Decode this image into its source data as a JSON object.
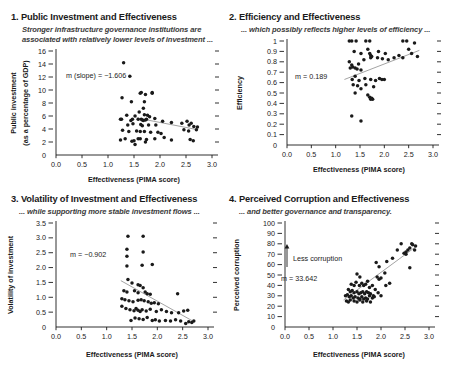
{
  "figure": {
    "panel_count": 4
  },
  "panels": [
    {
      "title": "1. Public Investment and Effectiveness",
      "subtitle_line1": "Stronger infrastructure governance institutions are",
      "subtitle_line2": "associated with relatively lower levels of investment ...",
      "ylabel_line1": "Public investment",
      "ylabel_line2": "(as a percentage of GDP)",
      "xlabel": "Effectiveness (PIMA score)",
      "slope_label": "m (slope) = −1.606"
    },
    {
      "title": "2. Efficiency and Effectiveness",
      "subtitle_line1": "... which possibly reflects higher levels of efficiency ...",
      "subtitle_line2": "",
      "ylabel_line1": "Efficiency",
      "ylabel_line2": "",
      "xlabel": "Effectiveness (PIMA score)",
      "slope_label": "m = 0.189"
    },
    {
      "title": "3. Volatility of Investment and Effectiveness",
      "subtitle_line1": "... while supporting more stable investment flows ...",
      "subtitle_line2": "",
      "ylabel_line1": "Volatility of investment",
      "ylabel_line2": "",
      "xlabel": "Effectiveness (PIMA score)",
      "slope_label": "m = −0.902"
    },
    {
      "title": "4. Perceived Corruption and Effectiveness",
      "subtitle_line1": "... and better governance and transparency.",
      "subtitle_line2": "",
      "ylabel_line1": "Perceived corruption",
      "ylabel_line2": "",
      "xlabel": "Effectiveness (PIMA score)",
      "slope_label": "m = 33.642",
      "arrow_label": "Less corruption"
    }
  ],
  "chart_data": [
    {
      "type": "scatter",
      "title": "1. Public Investment and Effectiveness",
      "subtitle": "Stronger infrastructure governance institutions are associated with relatively lower levels of investment ...",
      "xlabel": "Effectiveness (PIMA score)",
      "ylabel": "Public investment (as a percentage of GDP)",
      "xlim": [
        0.0,
        3.0
      ],
      "ylim": [
        0,
        16
      ],
      "xticks": [
        "0.0",
        "0.5",
        "1.0",
        "1.5",
        "2.0",
        "2.5",
        "3.0"
      ],
      "yticks": [
        "0",
        "2",
        "4",
        "6",
        "8",
        "10",
        "12",
        "14",
        "16"
      ],
      "grid": false,
      "legend": "none",
      "annotation": "m (slope) = −1.606",
      "slope": -1.606,
      "fit_line": {
        "x0": 1.55,
        "y0": 5.7,
        "x1": 2.72,
        "y1": 3.9
      },
      "points": [
        [
          1.3,
          14.2
        ],
        [
          1.42,
          12.1
        ],
        [
          1.27,
          8.8
        ],
        [
          1.62,
          9.5
        ],
        [
          1.64,
          9.6
        ],
        [
          1.72,
          9.3
        ],
        [
          1.85,
          9.5
        ],
        [
          1.85,
          9.6
        ],
        [
          1.7,
          8.2
        ],
        [
          1.45,
          8.2
        ],
        [
          1.68,
          7.2
        ],
        [
          1.6,
          6.6
        ],
        [
          1.36,
          6.1
        ],
        [
          1.52,
          6.0
        ],
        [
          1.7,
          6.2
        ],
        [
          1.76,
          6.1
        ],
        [
          1.8,
          5.9
        ],
        [
          1.24,
          5.5
        ],
        [
          1.26,
          5.5
        ],
        [
          1.47,
          5.5
        ],
        [
          1.44,
          5.3
        ],
        [
          1.58,
          5.5
        ],
        [
          1.64,
          5.5
        ],
        [
          1.66,
          5.4
        ],
        [
          1.68,
          5.3
        ],
        [
          1.72,
          5.4
        ],
        [
          1.74,
          5.5
        ],
        [
          1.9,
          5.6
        ],
        [
          2.05,
          5.2
        ],
        [
          2.22,
          5.0
        ],
        [
          1.38,
          4.6
        ],
        [
          1.48,
          4.8
        ],
        [
          1.63,
          4.7
        ],
        [
          1.66,
          4.5
        ],
        [
          1.78,
          4.6
        ],
        [
          1.92,
          4.6
        ],
        [
          2.42,
          4.9
        ],
        [
          2.52,
          5.2
        ],
        [
          2.56,
          4.6
        ],
        [
          2.6,
          4.9
        ],
        [
          2.65,
          4.4
        ],
        [
          2.72,
          4.3
        ],
        [
          1.28,
          3.8
        ],
        [
          1.4,
          3.6
        ],
        [
          1.55,
          3.7
        ],
        [
          1.62,
          3.6
        ],
        [
          1.7,
          3.6
        ],
        [
          1.82,
          3.5
        ],
        [
          1.96,
          3.5
        ],
        [
          2.02,
          3.3
        ],
        [
          2.46,
          3.9
        ],
        [
          2.55,
          3.7
        ],
        [
          2.7,
          3.9
        ],
        [
          1.24,
          2.3
        ],
        [
          1.33,
          2.5
        ],
        [
          1.46,
          2.1
        ],
        [
          1.5,
          2.2
        ],
        [
          1.58,
          2.5
        ],
        [
          1.62,
          2.5
        ],
        [
          1.74,
          2.4
        ],
        [
          1.9,
          2.5
        ],
        [
          2.08,
          2.7
        ],
        [
          2.22,
          2.3
        ],
        [
          2.58,
          2.4
        ],
        [
          2.64,
          2.2
        ],
        [
          1.52,
          1.6
        ],
        [
          1.72,
          2.0
        ]
      ]
    },
    {
      "type": "scatter",
      "title": "2. Efficiency and Effectiveness",
      "subtitle": "... which possibly reflects higher levels of efficiency ...",
      "xlabel": "Effectiveness (PIMA score)",
      "ylabel": "Efficiency",
      "xlim": [
        0.0,
        3.0
      ],
      "ylim": [
        0,
        1
      ],
      "xticks": [
        "0.0",
        "0.5",
        "1.0",
        "1.5",
        "2.0",
        "2.5",
        "3.0"
      ],
      "yticks": [
        "0",
        "0.1",
        "0.2",
        "0.3",
        "0.4",
        "0.5",
        "0.6",
        "0.7",
        "0.8",
        "0.9",
        "1"
      ],
      "grid": false,
      "legend": "none",
      "annotation": "m = 0.189",
      "slope": 0.189,
      "fit_line": {
        "x0": 1.18,
        "y0": 0.63,
        "x1": 2.72,
        "y1": 0.91
      },
      "points": [
        [
          1.28,
          1.0
        ],
        [
          1.33,
          1.0
        ],
        [
          1.42,
          1.0
        ],
        [
          1.62,
          1.0
        ],
        [
          1.7,
          1.0
        ],
        [
          2.38,
          1.0
        ],
        [
          2.46,
          1.0
        ],
        [
          2.62,
          0.98
        ],
        [
          1.38,
          0.9
        ],
        [
          1.52,
          0.88
        ],
        [
          1.66,
          0.92
        ],
        [
          1.7,
          0.88
        ],
        [
          1.72,
          0.86
        ],
        [
          1.74,
          0.85
        ],
        [
          1.88,
          0.9
        ],
        [
          2.02,
          0.88
        ],
        [
          2.5,
          0.92
        ],
        [
          2.56,
          0.88
        ],
        [
          2.68,
          0.85
        ],
        [
          1.28,
          0.8
        ],
        [
          1.33,
          0.77
        ],
        [
          1.35,
          0.75
        ],
        [
          1.47,
          0.78
        ],
        [
          1.58,
          0.82
        ],
        [
          1.72,
          0.84
        ],
        [
          1.86,
          0.84
        ],
        [
          1.96,
          0.83
        ],
        [
          2.08,
          0.82
        ],
        [
          2.2,
          0.84
        ],
        [
          2.3,
          0.86
        ],
        [
          1.3,
          0.74
        ],
        [
          1.4,
          0.74
        ],
        [
          1.44,
          0.73
        ],
        [
          1.52,
          0.72
        ],
        [
          2.38,
          0.84
        ],
        [
          1.34,
          0.63
        ],
        [
          1.4,
          0.66
        ],
        [
          1.48,
          0.62
        ],
        [
          1.6,
          0.64
        ],
        [
          1.72,
          0.63
        ],
        [
          1.82,
          0.62
        ],
        [
          1.9,
          0.64
        ],
        [
          1.95,
          0.63
        ],
        [
          2.0,
          0.63
        ],
        [
          1.36,
          0.58
        ],
        [
          1.45,
          0.57
        ],
        [
          1.52,
          0.54
        ],
        [
          1.62,
          0.58
        ],
        [
          1.78,
          0.56
        ],
        [
          1.4,
          0.5
        ],
        [
          1.66,
          0.48
        ],
        [
          1.7,
          0.46
        ],
        [
          1.72,
          0.44
        ],
        [
          1.74,
          0.45
        ],
        [
          1.76,
          0.44
        ],
        [
          1.33,
          0.28
        ],
        [
          1.52,
          0.23
        ]
      ]
    },
    {
      "type": "scatter",
      "title": "3. Volatility of Investment and Effectiveness",
      "subtitle": "... while supporting more stable investment flows ...",
      "xlabel": "Effectiveness (PIMA score)",
      "ylabel": "Volatility of investment",
      "xlim": [
        0.0,
        3.0
      ],
      "ylim": [
        0,
        3.5
      ],
      "xticks": [
        "0.0",
        "0.5",
        "1.0",
        "1.5",
        "2.0",
        "2.5",
        "3.0"
      ],
      "yticks": [
        "0",
        "0.5",
        "1.0",
        "1.5",
        "2.0",
        "2.5",
        "3.0",
        "3.5"
      ],
      "grid": false,
      "legend": "none",
      "annotation": "m = −0.902",
      "slope": -0.902,
      "fit_line": {
        "x0": 1.28,
        "y0": 1.56,
        "x1": 2.72,
        "y1": 0.18
      },
      "points": [
        [
          1.42,
          3.05
        ],
        [
          1.72,
          3.05
        ],
        [
          1.4,
          2.62
        ],
        [
          1.4,
          2.38
        ],
        [
          1.72,
          2.52
        ],
        [
          1.4,
          2.05
        ],
        [
          1.7,
          2.08
        ],
        [
          1.9,
          2.1
        ],
        [
          1.42,
          1.6
        ],
        [
          1.5,
          1.48
        ],
        [
          1.62,
          1.42
        ],
        [
          1.66,
          1.4
        ],
        [
          1.72,
          1.32
        ],
        [
          1.34,
          1.22
        ],
        [
          1.4,
          1.18
        ],
        [
          1.55,
          1.22
        ],
        [
          1.62,
          1.15
        ],
        [
          1.76,
          1.18
        ],
        [
          1.8,
          1.12
        ],
        [
          1.86,
          1.1
        ],
        [
          2.4,
          1.12
        ],
        [
          1.3,
          0.95
        ],
        [
          1.36,
          0.92
        ],
        [
          1.44,
          0.88
        ],
        [
          1.52,
          0.85
        ],
        [
          1.62,
          0.9
        ],
        [
          1.68,
          0.92
        ],
        [
          1.74,
          0.88
        ],
        [
          1.82,
          0.85
        ],
        [
          1.88,
          0.8
        ],
        [
          1.94,
          0.82
        ],
        [
          2.02,
          0.78
        ],
        [
          1.3,
          0.7
        ],
        [
          1.38,
          0.62
        ],
        [
          1.46,
          0.58
        ],
        [
          1.54,
          0.55
        ],
        [
          1.58,
          0.62
        ],
        [
          1.62,
          0.56
        ],
        [
          1.66,
          0.52
        ],
        [
          1.7,
          0.58
        ],
        [
          1.78,
          0.54
        ],
        [
          1.86,
          0.6
        ],
        [
          1.98,
          0.52
        ],
        [
          2.08,
          0.58
        ],
        [
          2.18,
          0.52
        ],
        [
          2.28,
          0.48
        ],
        [
          2.42,
          0.48
        ],
        [
          2.52,
          0.54
        ],
        [
          2.6,
          0.56
        ],
        [
          1.48,
          0.22
        ],
        [
          1.56,
          0.3
        ],
        [
          1.64,
          0.28
        ],
        [
          1.72,
          0.25
        ],
        [
          1.8,
          0.32
        ],
        [
          1.9,
          0.22
        ],
        [
          1.96,
          0.24
        ],
        [
          2.04,
          0.2
        ],
        [
          2.16,
          0.22
        ],
        [
          2.26,
          0.2
        ],
        [
          2.36,
          0.24
        ],
        [
          2.46,
          0.2
        ],
        [
          2.56,
          0.12
        ],
        [
          2.62,
          0.18
        ],
        [
          2.68,
          0.15
        ],
        [
          2.72,
          0.2
        ]
      ]
    },
    {
      "type": "scatter",
      "title": "4. Perceived Corruption and Effectiveness",
      "subtitle": "... and better governance and transparency.",
      "xlabel": "Effectiveness (PIMA score)",
      "ylabel": "Perceived corruption",
      "xlim": [
        0.0,
        3.0
      ],
      "ylim": [
        0,
        100
      ],
      "xticks": [
        "0.0",
        "0.5",
        "1.0",
        "1.5",
        "2.0",
        "2.5",
        "3.0"
      ],
      "yticks": [
        "0",
        "10",
        "20",
        "30",
        "40",
        "50",
        "60",
        "70",
        "80",
        "90",
        "100"
      ],
      "grid": false,
      "legend": "none",
      "annotation": "m = 33.642",
      "arrow_annotation": "Less corruption",
      "slope": 33.642,
      "fit_line": {
        "x0": 1.22,
        "y0": 26,
        "x1": 2.72,
        "y1": 77
      },
      "points": [
        [
          2.34,
          74
        ],
        [
          2.42,
          80
        ],
        [
          2.52,
          72
        ],
        [
          2.56,
          74
        ],
        [
          2.6,
          76
        ],
        [
          2.64,
          80
        ],
        [
          2.66,
          79
        ],
        [
          2.7,
          74
        ],
        [
          2.72,
          78
        ],
        [
          2.48,
          71
        ],
        [
          2.52,
          70
        ],
        [
          2.24,
          66
        ],
        [
          2.6,
          57
        ],
        [
          1.9,
          62
        ],
        [
          1.96,
          58
        ],
        [
          2.08,
          52
        ],
        [
          2.12,
          63
        ],
        [
          1.92,
          48
        ],
        [
          1.96,
          46
        ],
        [
          2.0,
          47
        ],
        [
          1.5,
          51
        ],
        [
          1.56,
          48
        ],
        [
          2.1,
          40
        ],
        [
          2.18,
          42
        ],
        [
          1.38,
          41
        ],
        [
          1.44,
          40
        ],
        [
          1.48,
          43
        ],
        [
          1.55,
          40
        ],
        [
          1.6,
          42
        ],
        [
          1.64,
          40
        ],
        [
          1.68,
          41
        ],
        [
          1.72,
          44
        ],
        [
          1.76,
          38
        ],
        [
          1.82,
          40
        ],
        [
          1.88,
          36
        ],
        [
          1.94,
          33
        ],
        [
          2.0,
          30
        ],
        [
          1.32,
          36
        ],
        [
          1.36,
          34
        ],
        [
          1.4,
          35
        ],
        [
          1.44,
          33
        ],
        [
          1.5,
          34
        ],
        [
          1.54,
          32
        ],
        [
          1.58,
          33
        ],
        [
          1.62,
          34
        ],
        [
          1.66,
          32
        ],
        [
          1.7,
          34
        ],
        [
          1.74,
          33
        ],
        [
          1.78,
          32
        ],
        [
          1.84,
          30
        ],
        [
          1.26,
          30
        ],
        [
          1.3,
          31
        ],
        [
          1.34,
          29
        ],
        [
          1.38,
          30
        ],
        [
          1.42,
          28
        ],
        [
          1.46,
          29
        ],
        [
          1.52,
          28
        ],
        [
          1.56,
          27
        ],
        [
          1.6,
          29
        ],
        [
          1.64,
          27
        ],
        [
          1.68,
          28
        ],
        [
          1.72,
          27
        ],
        [
          1.76,
          30
        ],
        [
          1.82,
          28
        ],
        [
          1.28,
          25
        ],
        [
          1.32,
          24
        ],
        [
          1.36,
          26
        ],
        [
          1.44,
          25
        ],
        [
          1.5,
          24
        ],
        [
          1.56,
          26
        ],
        [
          1.62,
          24
        ],
        [
          1.7,
          25
        ],
        [
          1.78,
          24
        ],
        [
          1.86,
          29
        ]
      ]
    }
  ]
}
